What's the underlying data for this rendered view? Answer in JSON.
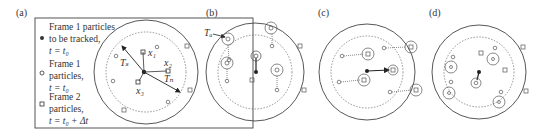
{
  "panels": {
    "a": {
      "label": "(a)",
      "legend": [
        {
          "symbol": "filled-dot",
          "lines": [
            "Frame 1 particles",
            "to be tracked,",
            "t = t₀"
          ]
        },
        {
          "symbol": "open-circle",
          "lines": [
            "Frame 1",
            "particles,",
            "t = t₀"
          ]
        },
        {
          "symbol": "open-square",
          "lines": [
            "Frame 2",
            "particles,",
            "t = t₀ + Δt"
          ]
        }
      ],
      "annotations": {
        "ts": "Tₛ",
        "tn": "Tₙ",
        "x1": "x₁",
        "x2": "x₂",
        "x3": "x₃"
      }
    },
    "b": {
      "label": "(b)",
      "annotation": "Tₐ"
    },
    "c": {
      "label": "(c)"
    },
    "d": {
      "label": "(d)"
    }
  }
}
